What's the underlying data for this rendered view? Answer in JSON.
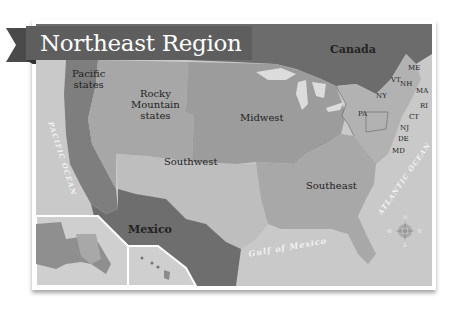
{
  "title": "Northeast Region",
  "regions": [
    {
      "name": "Pacific states",
      "lines": [
        "Pacific",
        "states"
      ]
    },
    {
      "name": "Rocky Mountain states",
      "lines": [
        "Rocky",
        "Mountain",
        "states"
      ]
    },
    {
      "name": "Midwest",
      "lines": [
        "Midwest"
      ]
    },
    {
      "name": "Southwest",
      "lines": [
        "Southwest"
      ]
    },
    {
      "name": "Southeast",
      "lines": [
        "Southeast"
      ]
    }
  ],
  "countries": {
    "canada": "Canada",
    "mexico": "Mexico"
  },
  "northeast_states": [
    "ME",
    "VT",
    "NH",
    "MA",
    "NY",
    "RI",
    "CT",
    "PA",
    "NJ",
    "DE",
    "MD"
  ],
  "water_bodies": {
    "pacific": "PACIFIC OCEAN",
    "atlantic": "ATLANTIC OCEAN",
    "gulf": "Gulf of Mexico"
  },
  "compass": {
    "n": "N",
    "s": "S",
    "e": "E",
    "w": "W"
  },
  "colors": {
    "banner": "#5e5e5e",
    "ocean": "#c8c8c8",
    "canada": "#6e6e6e",
    "mexico": "#6e6e6e",
    "pacific_states": "#7f7f7f",
    "rocky": "#a6a6a6",
    "midwest": "#9d9d9d",
    "southwest": "#bdbdbd",
    "southeast": "#a8a8a8",
    "northeast": "#b3b3b3",
    "lakes": "#dcdcdc"
  }
}
